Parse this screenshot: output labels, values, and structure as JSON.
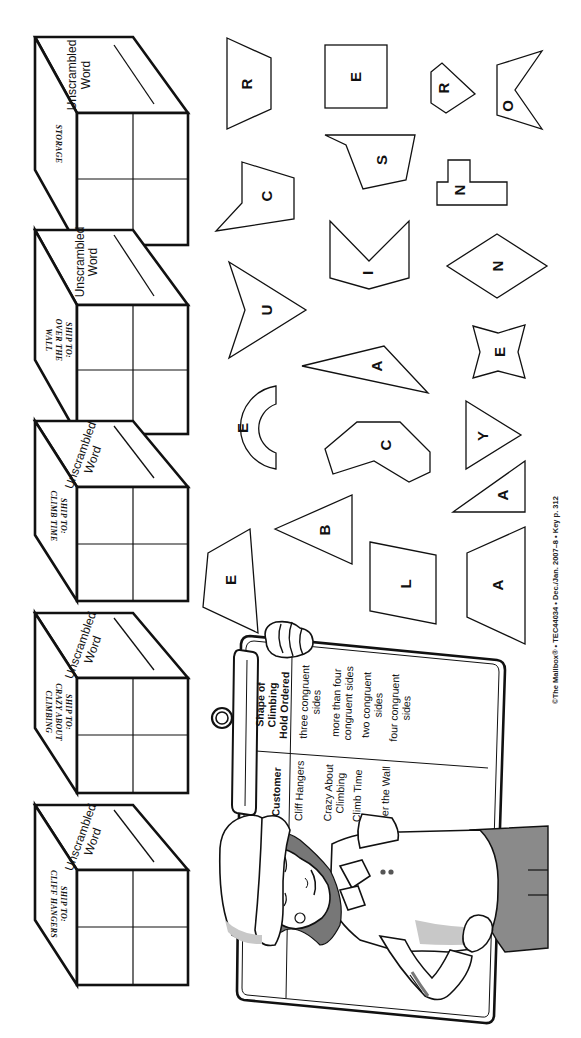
{
  "worksheet": {
    "orientation": "rotated-90-clockwise",
    "credit_line": "©The Mailbox® • TEC44034 • Dec./Jan. 2007–8 • Key p. 312"
  },
  "boxes": [
    {
      "label_lines": [
        "STORAGE"
      ],
      "word_label_lines": [
        "Unscrambled",
        "Word"
      ]
    },
    {
      "label_lines": [
        "SHIP TO:",
        "OVER THE",
        "WALL"
      ],
      "word_label_lines": [
        "Unscrambled",
        "Word"
      ]
    },
    {
      "label_lines": [
        "SHIP TO:",
        "CLIMB TIME"
      ],
      "word_label_lines": [
        "Unscrambled",
        "Word"
      ]
    },
    {
      "label_lines": [
        "SHIP TO:",
        "CRAZY ABOUT",
        "CLIMBING"
      ],
      "word_label_lines": [
        "Unscrambled",
        "Word"
      ]
    },
    {
      "label_lines": [
        "SHIP TO:",
        "CLIFF HANGERS"
      ],
      "word_label_lines": [
        "Unscrambled",
        "Word"
      ]
    }
  ],
  "shapes": [
    {
      "letter": "R",
      "shape": "trapezoid"
    },
    {
      "letter": "E",
      "shape": "square"
    },
    {
      "letter": "R",
      "shape": "pentagon"
    },
    {
      "letter": "O",
      "shape": "concave-hexagon"
    },
    {
      "letter": "C",
      "shape": "concave-pentagon"
    },
    {
      "letter": "S",
      "shape": "concave-quadrilateral"
    },
    {
      "letter": "N",
      "shape": "t-shaped-octagon"
    },
    {
      "letter": "I",
      "shape": "concave-pentagon"
    },
    {
      "letter": "N",
      "shape": "rhombus"
    },
    {
      "letter": "U",
      "shape": "concave-quadrilateral"
    },
    {
      "letter": "A",
      "shape": "scalene-triangle"
    },
    {
      "letter": "E",
      "shape": "four-point-star"
    },
    {
      "letter": "E",
      "shape": "half-annulus"
    },
    {
      "letter": "C",
      "shape": "concave-heptagon"
    },
    {
      "letter": "Y",
      "shape": "isosceles-triangle"
    },
    {
      "letter": "A",
      "shape": "right-triangle"
    },
    {
      "letter": "B",
      "shape": "isosceles-triangle"
    },
    {
      "letter": "E",
      "shape": "quadrilateral"
    },
    {
      "letter": "L",
      "shape": "parallelogram"
    },
    {
      "letter": "A",
      "shape": "trapezoid"
    }
  ],
  "clipboard": {
    "headers": [
      "Customer",
      "Shape of Climbing Hold Ordered"
    ],
    "header_lines": [
      [
        "Customer"
      ],
      [
        "Shape of",
        "Climbing",
        "Hold Ordered"
      ]
    ],
    "rows": [
      {
        "customer_lines": [
          "Cliff Hangers"
        ],
        "shape_lines": [
          "three congruent",
          "sides"
        ]
      },
      {
        "customer_lines": [
          "Crazy About",
          "Climbing"
        ],
        "shape_lines": [
          "more than four",
          "congruent sides"
        ]
      },
      {
        "customer_lines": [
          "Climb Time"
        ],
        "shape_lines": [
          "two congruent",
          "sides"
        ]
      },
      {
        "customer_lines": [
          "Over the Wall"
        ],
        "shape_lines": [
          "four congruent",
          "sides"
        ]
      }
    ]
  },
  "colors": {
    "ink": "#111111",
    "paper": "#ffffff",
    "hair_gray": "#777777",
    "pants_gray": "#8a8a8a"
  }
}
